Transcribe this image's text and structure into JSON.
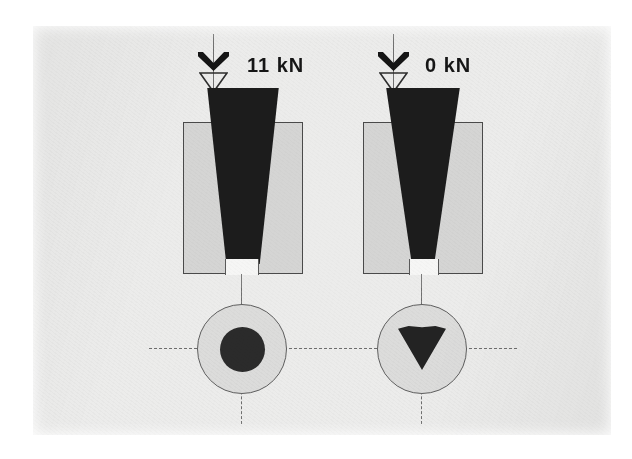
{
  "figure": {
    "background_color": "#ffffff",
    "plate_color": "#ececeb"
  },
  "colors": {
    "wedge": "#1c1c1c",
    "die_block": "#d5d5d4",
    "outline": "#4a4a4a",
    "centerline": "#6e6e6e",
    "label_text": "#161616",
    "tip_gap": "#f6f6f5"
  },
  "panels": [
    {
      "id": "left",
      "load_label": "11 kN",
      "load_value": 11,
      "load_unit": "kN",
      "load_symbol": "load-arrow-symbol",
      "elevation": {
        "die_block": "die-block",
        "wedge": "tapered-wedge",
        "tip_gap": "wedge-tip-gap"
      },
      "plan": {
        "outer_shape": "circle",
        "inner_shape": "circle",
        "inner_label": "contact-circle"
      }
    },
    {
      "id": "right",
      "load_label": "0 kN",
      "load_value": 0,
      "load_unit": "kN",
      "load_symbol": "load-arrow-symbol",
      "elevation": {
        "die_block": "die-block",
        "wedge": "tapered-wedge",
        "tip_gap": "wedge-tip-gap"
      },
      "plan": {
        "outer_shape": "circle",
        "inner_shape": "inverted-triangle",
        "inner_label": "contact-triangle"
      }
    }
  ]
}
